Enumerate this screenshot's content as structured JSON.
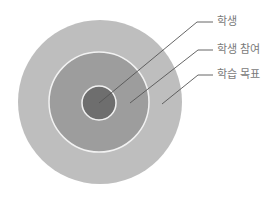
{
  "diagram": {
    "type": "concentric-circles",
    "center": [
      100,
      102
    ],
    "colors": {
      "background": "#ffffff",
      "outer": "#bebebe",
      "middle": "#9d9d9d",
      "inner": "#6e6e6e",
      "ring_border": "#f2f2f2",
      "leader_line": "#555555",
      "label_text": "#7a7a7a"
    },
    "circles": [
      {
        "name": "learning-goal",
        "radius": 82
      },
      {
        "name": "student-engagement",
        "radius": 50
      },
      {
        "name": "student",
        "radius": 17
      }
    ],
    "labels": [
      {
        "text": "학생",
        "x": 217,
        "y": 16
      },
      {
        "text": "학생 참여",
        "x": 217,
        "y": 44
      },
      {
        "text": "학습 목표",
        "x": 217,
        "y": 69
      }
    ]
  }
}
